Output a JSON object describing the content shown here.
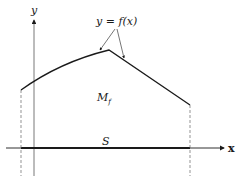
{
  "figure": {
    "labels": {
      "y_axis": "y",
      "x_axis": "x",
      "function": "y = f(x)",
      "region_main": "M",
      "region_sub": "f",
      "support": "S"
    },
    "colors": {
      "ink": "#1a1a1a",
      "dashed": "#666666",
      "background": "#ffffff"
    }
  }
}
